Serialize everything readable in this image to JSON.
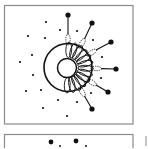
{
  "figure": {
    "type": "schematic-diagram",
    "colors": {
      "stroke": "#111111",
      "frame": "#8a8a8a",
      "background": "#ffffff"
    },
    "panels": [
      {
        "id": "panel-top",
        "x": 4.5,
        "y": 5.5,
        "w": 128.5,
        "h": 118.5
      },
      {
        "id": "panel-bottom",
        "x": 4.5,
        "y": 134.5,
        "w": 128.5,
        "h": 20
      }
    ],
    "outer_ring": {
      "cx": 68,
      "cy": 67.5,
      "r": 24
    },
    "inner_circle": {
      "cx": 67,
      "cy": 68,
      "r": 9.5
    },
    "petals": {
      "count": 13,
      "start_deg": -95,
      "end_deg": 100
    },
    "tethered_dots": [
      {
        "x": 68,
        "y": 15,
        "angle": -90
      },
      {
        "x": 92,
        "y": 23,
        "angle": -60
      },
      {
        "x": 111,
        "y": 42,
        "angle": -32
      },
      {
        "x": 116,
        "y": 69,
        "angle": 2
      },
      {
        "x": 108,
        "y": 92,
        "angle": 32
      },
      {
        "x": 92,
        "y": 109,
        "angle": 60
      }
    ],
    "small_dots": [
      [
        46,
        22
      ],
      [
        28,
        36
      ],
      [
        45,
        38
      ],
      [
        60,
        30
      ],
      [
        32,
        55
      ],
      [
        20,
        62
      ],
      [
        33,
        75
      ],
      [
        26,
        91
      ],
      [
        41,
        90
      ],
      [
        58,
        100
      ],
      [
        43,
        108
      ],
      [
        77,
        31
      ],
      [
        93,
        40
      ],
      [
        102,
        57
      ],
      [
        101,
        78
      ],
      [
        91,
        93
      ],
      [
        77,
        102
      ],
      [
        67,
        116
      ]
    ],
    "bottom_panel_dots": {
      "large": [
        [
          51,
          142
        ],
        [
          76,
          141
        ]
      ],
      "small": [
        [
          60,
          146
        ],
        [
          86,
          146
        ]
      ]
    },
    "side_mark": {
      "x": 146,
      "y": 136,
      "h": 10
    }
  }
}
